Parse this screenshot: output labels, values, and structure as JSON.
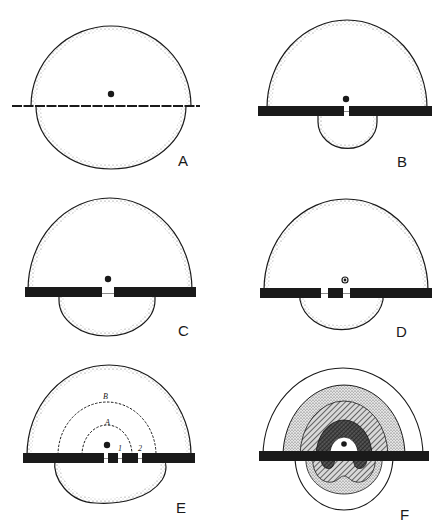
{
  "figure": {
    "panels": [
      {
        "id": "A",
        "label": "A",
        "barrier": "dashed thin line",
        "gaps": 0
      },
      {
        "id": "B",
        "label": "B",
        "barrier": "thick bar",
        "gaps": 1
      },
      {
        "id": "C",
        "label": "C",
        "barrier": "thick bar",
        "gaps": 1
      },
      {
        "id": "D",
        "label": "D",
        "barrier": "thick bar",
        "gaps": 2
      },
      {
        "id": "E",
        "label": "E",
        "barrier": "thick bar",
        "gaps": 3,
        "inner_labels": {
          "arc_a": "A",
          "arc_b": "B",
          "gap_1": "1",
          "gap_2": "2"
        }
      },
      {
        "id": "F",
        "label": "F",
        "barrier": "thick bar",
        "gaps": 0,
        "zones": [
          "white outer",
          "light stipple",
          "hatched",
          "dark crosshatch",
          "white core"
        ]
      }
    ]
  },
  "colors": {
    "ink": "#1a1a1a",
    "paper": "#ffffff",
    "stipple": "#7a7a7a"
  }
}
